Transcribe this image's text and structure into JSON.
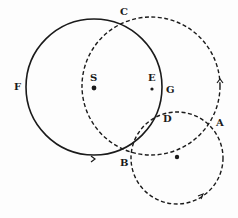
{
  "diagram": {
    "type": "geometric-construction",
    "colors": {
      "stroke": "#1a1a1a",
      "background": "#fdfdfd"
    },
    "circles": [
      {
        "id": "solid-circle-S",
        "style": "solid",
        "cx": 94,
        "cy": 87,
        "r": 68,
        "center_label": "S"
      },
      {
        "id": "dashed-circle-E",
        "style": "dashed",
        "cx": 151,
        "cy": 86,
        "r": 69,
        "center_label": "E"
      },
      {
        "id": "small-dashed-circle",
        "style": "dashed",
        "cx": 177,
        "cy": 158,
        "r": 46,
        "center_label": ""
      }
    ],
    "points": [
      {
        "label": "C",
        "x": 125,
        "y": 17,
        "lx": 120,
        "ly": 15
      },
      {
        "label": "S",
        "x": 94,
        "y": 88,
        "lx": 90,
        "ly": 81
      },
      {
        "label": "E",
        "x": 152,
        "y": 89,
        "lx": 148,
        "ly": 81
      },
      {
        "label": "G",
        "x": 163,
        "y": 89,
        "lx": 166,
        "ly": 93
      },
      {
        "label": "F",
        "x": 26,
        "y": 87,
        "lx": 14,
        "ly": 90
      },
      {
        "label": "D",
        "x": 160,
        "y": 112,
        "lx": 163,
        "ly": 122
      },
      {
        "label": "A",
        "x": 214,
        "y": 124,
        "lx": 216,
        "ly": 126
      },
      {
        "label": "B",
        "x": 127,
        "y": 160,
        "lx": 120,
        "ly": 166
      }
    ],
    "arrows": [
      {
        "on": "solid-circle-S",
        "x": 94,
        "y": 159,
        "direction": "right"
      },
      {
        "on": "dashed-circle-E",
        "x": 220,
        "y": 80,
        "direction": "up"
      },
      {
        "on": "small-dashed-circle",
        "x": 202,
        "y": 196,
        "direction": "up-right"
      }
    ]
  }
}
